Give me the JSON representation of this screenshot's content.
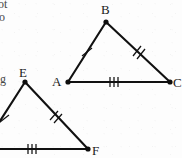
{
  "figure": {
    "background_color": "#fdfdfd",
    "line_color": "#111111",
    "label_color": "#1a1a1a",
    "width": 182,
    "height": 158,
    "triangles": [
      {
        "id": "ABC",
        "name": "triangle-abc",
        "complete": true,
        "vertices": [
          {
            "label": "A",
            "x": 68,
            "y": 82,
            "label_x": 52,
            "label_y": 80,
            "dot": true
          },
          {
            "label": "B",
            "x": 106,
            "y": 22,
            "label_x": 101,
            "label_y": 13,
            "dot": true
          },
          {
            "label": "C",
            "x": 170,
            "y": 82,
            "label_x": 173,
            "label_y": 86,
            "dot": true
          }
        ],
        "sides": [
          {
            "id": "AB",
            "name": "side-ab",
            "from": "A",
            "to": "B",
            "ticks": 1
          },
          {
            "id": "BC",
            "name": "side-bc",
            "from": "B",
            "to": "C",
            "ticks": 2
          },
          {
            "id": "AC",
            "name": "side-ac",
            "from": "A",
            "to": "C",
            "ticks": 3
          }
        ]
      },
      {
        "id": "DEF",
        "name": "triangle-def",
        "complete": false,
        "note": "left vertex D is cropped outside the left edge of the image",
        "vertices": [
          {
            "label": "D",
            "x": -18,
            "y": 149,
            "label_x": -30,
            "label_y": 147,
            "dot": false
          },
          {
            "label": "E",
            "x": 25,
            "y": 82,
            "label_x": 20,
            "label_y": 77,
            "dot": true
          },
          {
            "label": "F",
            "x": 88,
            "y": 149,
            "label_x": 92,
            "label_y": 153,
            "dot": true
          }
        ],
        "sides": [
          {
            "id": "DE",
            "name": "side-de",
            "from": "D",
            "to": "E",
            "ticks": 1
          },
          {
            "id": "EF",
            "name": "side-ef",
            "from": "E",
            "to": "F",
            "ticks": 2
          },
          {
            "id": "DF",
            "name": "side-df",
            "from": "D",
            "to": "F",
            "ticks": 3
          }
        ]
      }
    ],
    "cropped_text_fragments": [
      {
        "name": "fragment-top-1",
        "text": "ot",
        "x": -2,
        "y": 8
      },
      {
        "name": "fragment-top-2",
        "text": "o",
        "x": -1,
        "y": 21
      },
      {
        "name": "fragment-left-1",
        "text": "g",
        "x": 0,
        "y": 82
      }
    ]
  }
}
